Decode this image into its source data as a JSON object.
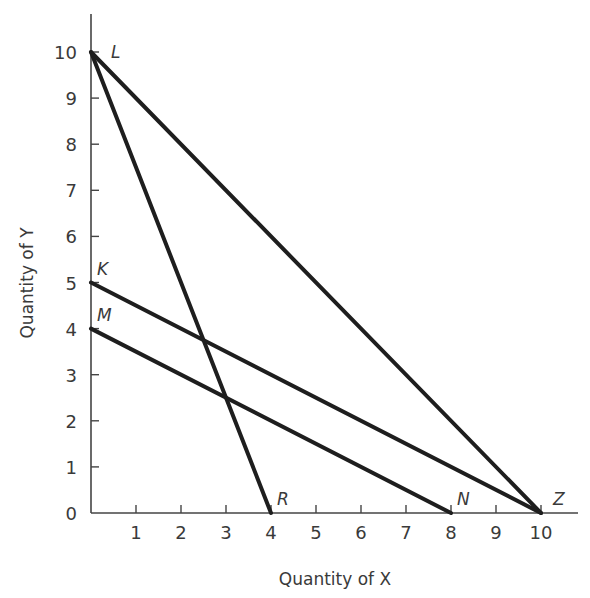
{
  "chart_data": {
    "type": "line",
    "title": "",
    "xlabel": "Quantity of X",
    "ylabel": "Quantity of Y",
    "xlim": [
      0,
      10.8
    ],
    "ylim": [
      0,
      10.9
    ],
    "grid": false,
    "legend": null,
    "x_ticks": [
      1,
      2,
      3,
      4,
      5,
      6,
      7,
      8,
      9,
      10
    ],
    "y_ticks": [
      0,
      1,
      2,
      3,
      4,
      5,
      6,
      7,
      8,
      9,
      10
    ],
    "series": [
      {
        "name": "LR",
        "points": [
          [
            0,
            10
          ],
          [
            4,
            0
          ]
        ],
        "start_label": "L",
        "end_label": "R"
      },
      {
        "name": "LZ",
        "points": [
          [
            0,
            10
          ],
          [
            10,
            0
          ]
        ],
        "start_label": "L",
        "end_label": "Z"
      },
      {
        "name": "KZ",
        "points": [
          [
            0,
            5
          ],
          [
            10,
            0
          ]
        ],
        "start_label": "K",
        "end_label": "Z"
      },
      {
        "name": "MN",
        "points": [
          [
            0,
            4
          ],
          [
            8,
            0
          ]
        ],
        "start_label": "M",
        "end_label": "N"
      }
    ],
    "point_labels": [
      {
        "text": "L",
        "x": 0,
        "y": 10
      },
      {
        "text": "K",
        "x": 0,
        "y": 5
      },
      {
        "text": "M",
        "x": 0,
        "y": 4
      },
      {
        "text": "R",
        "x": 4,
        "y": 0
      },
      {
        "text": "N",
        "x": 8,
        "y": 0
      },
      {
        "text": "Z",
        "x": 10,
        "y": 0
      }
    ]
  },
  "labels": {
    "x_axis": "Quantity of X",
    "y_axis": "Quantity of Y",
    "origin": "0"
  }
}
